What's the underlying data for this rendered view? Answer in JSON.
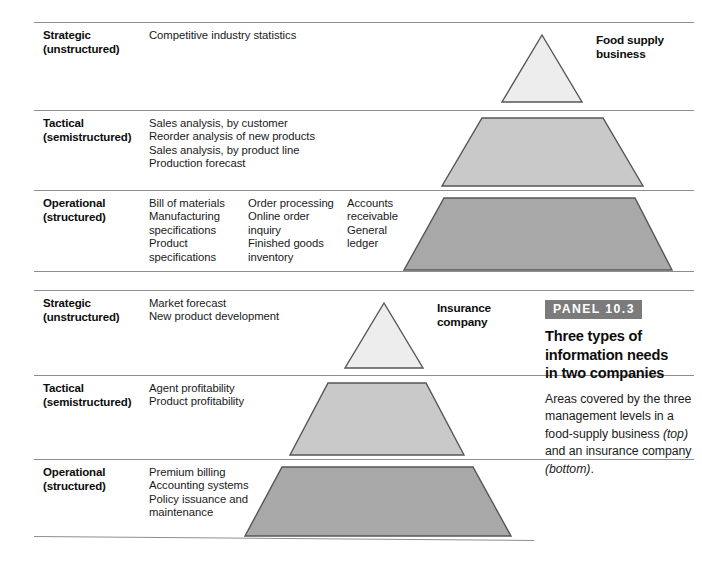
{
  "figure": {
    "type": "diagram",
    "kind": "stacked-pyramid-table",
    "caption_panel": {
      "badge": "PANEL 10.3",
      "title": "Three types of\ninformation needs\nin two companies",
      "body_plain_1": "Areas covered by the three management levels in a food-supply business ",
      "body_italic_1": "(top)",
      "body_plain_2": " and an insurance company ",
      "body_italic_2": "(bottom)",
      "body_plain_3": "."
    }
  },
  "sections": [
    {
      "name": "food-supply-business",
      "shape_caption": "Food supply\nbusiness",
      "rows": [
        {
          "level": "Strategic\n(unstructured)",
          "columns": [
            {
              "lines": "Competitive industry statistics"
            }
          ],
          "shape": "triangle",
          "shape_fill": "#ededed"
        },
        {
          "level": "Tactical\n(semistructured)",
          "columns": [
            {
              "lines": "Sales analysis, by customer\nReorder analysis of new products\nSales analysis, by product line\nProduction forecast"
            }
          ],
          "shape": "trapezoid",
          "shape_fill": "#c9c9c9"
        },
        {
          "level": "Operational\n(structured)",
          "columns": [
            {
              "lines": "Bill of materials\nManufacturing\n    specifications\nProduct\n    specifications"
            },
            {
              "lines": "Order processing\nOnline order\n    inquiry\nFinished goods\n    inventory"
            },
            {
              "lines": "Accounts\n    receivable\nGeneral\n    ledger"
            }
          ],
          "shape": "trapezoid",
          "shape_fill": "#a8a8a8"
        }
      ]
    },
    {
      "name": "insurance-company",
      "shape_caption": "Insurance\ncompany",
      "rows": [
        {
          "level": "Strategic\n(unstructured)",
          "columns": [
            {
              "lines": "Market forecast\nNew product development"
            }
          ],
          "shape": "triangle",
          "shape_fill": "#ededed"
        },
        {
          "level": "Tactical\n(semistructured)",
          "columns": [
            {
              "lines": "Agent profitability\nProduct profitability"
            }
          ],
          "shape": "trapezoid",
          "shape_fill": "#c9c9c9"
        },
        {
          "level": "Operational\n(structured)",
          "columns": [
            {
              "lines": "Premium billing\nAccounting systems\nPolicy issuance and\n    maintenance"
            }
          ],
          "shape": "trapezoid",
          "shape_fill": "#a8a8a8"
        }
      ]
    }
  ],
  "colors": {
    "rule": "#8e8e8e",
    "shape_stroke": "#555555",
    "badge_bg": "#7b7b7b",
    "strategic_fill": "#ededed",
    "tactical_fill": "#c9c9c9",
    "operational_fill": "#a8a8a8",
    "text": "#111111"
  }
}
